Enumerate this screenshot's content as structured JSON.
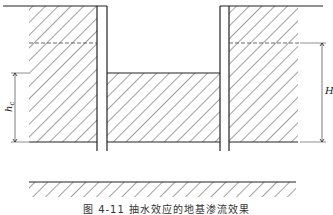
{
  "figure": {
    "caption": "图 4-11  抽水效应的地基渗流效果",
    "labels": {
      "left_dimension": "h",
      "left_dimension_subscript": "c",
      "right_dimension": "H"
    }
  },
  "colors": {
    "line": "#222222",
    "hatch": "#444444",
    "background": "#ffffff"
  }
}
